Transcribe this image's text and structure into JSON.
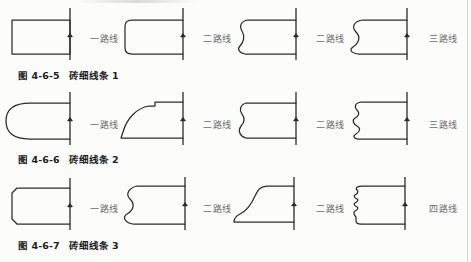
{
  "document": {
    "type": "technical-illustration-page",
    "language": "zh",
    "ink_color": "#2b2b2b",
    "label_color": "#6d6d6d",
    "page_background": "#fcfcfa"
  },
  "rows": [
    {
      "id": "row1",
      "caption_number": "图 4-6-5",
      "caption_title": "砖细线条 1",
      "figures": [
        {
          "name": "plain-rectangle-profile",
          "pass_label": "一路线"
        },
        {
          "name": "rounded-corner-profile",
          "pass_label": "二路线"
        },
        {
          "name": "single-ogee-profile",
          "pass_label": "二路线"
        },
        {
          "name": "deep-ogee-profile",
          "pass_label": "三路线"
        }
      ]
    },
    {
      "id": "row2",
      "caption_number": "图 4-6-6",
      "caption_title": "砖细线条 2",
      "figures": [
        {
          "name": "bullnose-半圆-profile",
          "pass_label": "一路线"
        },
        {
          "name": "quarter-round-cove-profile",
          "pass_label": "二路线"
        },
        {
          "name": "double-wave-profile",
          "pass_label": "二路线"
        },
        {
          "name": "multi-ripple-profile",
          "pass_label": "三路线"
        }
      ]
    },
    {
      "id": "row3",
      "caption_number": "图 4-6-7",
      "caption_title": "砖细线条 3",
      "figures": [
        {
          "name": "chamfered-rectangle-profile",
          "pass_label": "一路线"
        },
        {
          "name": "bulged-ogee-profile",
          "pass_label": "二路线"
        },
        {
          "name": "ogee-ramp-profile",
          "pass_label": "二路线"
        },
        {
          "name": "fine-ripple-profile",
          "pass_label": "四路线"
        }
      ]
    }
  ]
}
